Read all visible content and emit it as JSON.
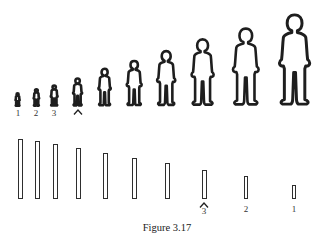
{
  "figure_caption": "Figure 3.17",
  "top_row": {
    "description": "Human silhouettes increasing in size from left to right",
    "figures": [
      {
        "cx": 18,
        "height": 13
      },
      {
        "cx": 36,
        "height": 17
      },
      {
        "cx": 54,
        "height": 21
      },
      {
        "cx": 78,
        "height": 28
      },
      {
        "cx": 105,
        "height": 38
      },
      {
        "cx": 134,
        "height": 46
      },
      {
        "cx": 166,
        "height": 56
      },
      {
        "cx": 203,
        "height": 68
      },
      {
        "cx": 246,
        "height": 79
      },
      {
        "cx": 295,
        "height": 93
      }
    ],
    "labels": [
      "1",
      "2",
      "3"
    ],
    "caret_under_index": 3
  },
  "bottom_row": {
    "description": "Vertical bars decreasing in height from left to right",
    "bars": [
      {
        "cx": 20,
        "top": 139
      },
      {
        "cx": 37,
        "top": 141
      },
      {
        "cx": 55,
        "top": 144
      },
      {
        "cx": 78,
        "top": 148
      },
      {
        "cx": 105,
        "top": 153
      },
      {
        "cx": 134,
        "top": 158
      },
      {
        "cx": 167,
        "top": 163
      },
      {
        "cx": 204,
        "top": 170
      },
      {
        "cx": 246,
        "top": 176
      },
      {
        "cx": 294,
        "top": 185
      }
    ],
    "labels": [
      "3",
      "2",
      "1"
    ],
    "caret_over_label": "3"
  }
}
